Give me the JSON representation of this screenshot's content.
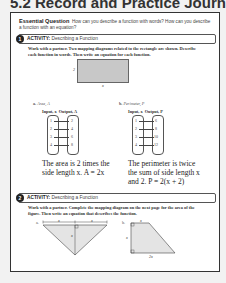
{
  "header": {
    "title": "5.2 Record and Practice Journal"
  },
  "essential_question": {
    "label": "Essential Question",
    "text": "How can you describe a function with words? How can you describe a function with an equation?"
  },
  "activity1": {
    "number": "1",
    "label": "ACTIVITY:",
    "title": "Describing a Function",
    "instructions": "Work with a partner. Two mapping diagrams related to the rectangle are shown. Describe each function in words. Then write an equation for each function.",
    "rectangle": {
      "height_label": "2",
      "width_label": "x"
    },
    "part_a": {
      "letter": "a.",
      "title": "Area, A",
      "input_header": "Input, x",
      "output_header": "Output, A",
      "inputs": [
        "1",
        "2",
        "3",
        "4"
      ],
      "outputs": [
        "2",
        "4",
        "6",
        "8"
      ],
      "answer_line1": "The area is 2 times the",
      "answer_line2": "side length x. A = 2x"
    },
    "part_b": {
      "letter": "b.",
      "title": "Perimeter, P",
      "input_header": "Input, x",
      "output_header": "Output, P",
      "inputs": [
        "1",
        "2",
        "3",
        "4"
      ],
      "outputs": [
        "6",
        "8",
        "10",
        "12"
      ],
      "answer_line1": "The perimeter is twice",
      "answer_line2": "the sum of side length x",
      "answer_line3": "and 2. P = 2(x + 2)"
    }
  },
  "activity2": {
    "number": "2",
    "label": "ACTIVITY:",
    "title": "Describing a Function",
    "instructions": "Work with a partner. Complete the mapping diagram on the next page for the area of the figure. Then write an equation that describes the function.",
    "part_a": {
      "letter": "a.",
      "labels": [
        "x",
        "x",
        "x"
      ]
    },
    "part_b": {
      "letter": "b.",
      "top_label": "x",
      "side_label": "x",
      "bottom_label": "2x"
    }
  }
}
